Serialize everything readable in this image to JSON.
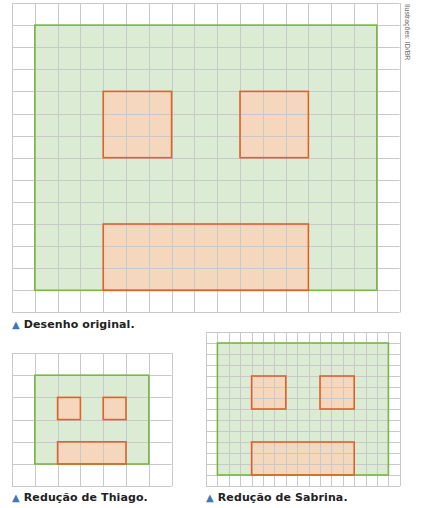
{
  "credit": "Ilustrações: ID/BR",
  "colors": {
    "grid": "#c9c9c9",
    "face_fill": "#dcebd3",
    "face_stroke": "#7ab648",
    "feature_fill": "#f5d7bd",
    "feature_stroke": "#e2612a",
    "caption_marker": "#3e78b2"
  },
  "figures": [
    {
      "id": "original",
      "caption": "Desenho original.",
      "grid": {
        "x": 12,
        "y": 3,
        "cols": 17,
        "rows": 14,
        "cell_w": 22.8,
        "cell_h": 22.1
      },
      "face": {
        "col": 1,
        "row": 1,
        "w": 15,
        "h": 12
      },
      "features": [
        {
          "name": "left-eye",
          "col": 4,
          "row": 4,
          "w": 3,
          "h": 3
        },
        {
          "name": "right-eye",
          "col": 10,
          "row": 4,
          "w": 3,
          "h": 3
        },
        {
          "name": "mouth",
          "col": 4,
          "row": 10,
          "w": 9,
          "h": 3
        }
      ],
      "caption_pos": {
        "x": 12,
        "y": 318
      }
    },
    {
      "id": "thiago",
      "caption": "Redução de Thiago.",
      "grid": {
        "x": 12,
        "y": 353,
        "cols": 7,
        "rows": 6,
        "cell_w": 22.8,
        "cell_h": 22.2
      },
      "face": {
        "col": 1,
        "row": 1,
        "w": 5,
        "h": 4
      },
      "features": [
        {
          "name": "left-eye",
          "col": 2,
          "row": 2,
          "w": 1,
          "h": 1
        },
        {
          "name": "right-eye",
          "col": 4,
          "row": 2,
          "w": 1,
          "h": 1
        },
        {
          "name": "mouth",
          "col": 2,
          "row": 4,
          "w": 3,
          "h": 1
        }
      ],
      "caption_pos": {
        "x": 12,
        "y": 491
      }
    },
    {
      "id": "sabrina",
      "caption": "Redução de Sabrina.",
      "grid": {
        "x": 206,
        "y": 332,
        "cols": 17,
        "rows": 14,
        "cell_w": 11.4,
        "cell_h": 11.0
      },
      "face": {
        "col": 1,
        "row": 1,
        "w": 15,
        "h": 12
      },
      "features": [
        {
          "name": "left-eye",
          "col": 4,
          "row": 4,
          "w": 3,
          "h": 3
        },
        {
          "name": "right-eye",
          "col": 10,
          "row": 4,
          "w": 3,
          "h": 3
        },
        {
          "name": "mouth",
          "col": 4,
          "row": 10,
          "w": 9,
          "h": 3
        }
      ],
      "caption_pos": {
        "x": 206,
        "y": 491
      }
    }
  ]
}
